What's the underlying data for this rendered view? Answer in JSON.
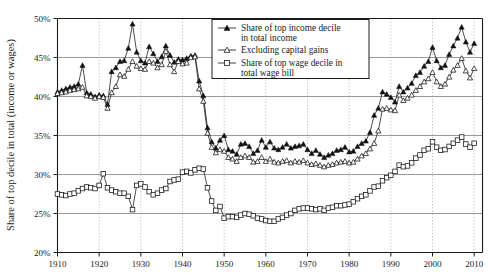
{
  "chart_data": {
    "type": "line",
    "title": "",
    "xlabel": "",
    "ylabel": "Share of top decile in total (income or wages)",
    "xlim": [
      1910,
      2012
    ],
    "ylim": [
      20,
      50
    ],
    "grid": "horizontal-solid-and-vertical-dotted",
    "legend_position": "top-center",
    "y_ticks": [
      "20%",
      "25%",
      "30%",
      "35%",
      "40%",
      "45%",
      "50%"
    ],
    "y_tick_values": [
      20,
      25,
      30,
      35,
      40,
      45,
      50
    ],
    "x_ticks": [
      "1910",
      "1920",
      "1930",
      "1940",
      "1950",
      "1960",
      "1970",
      "1980",
      "1990",
      "2000",
      "2010"
    ],
    "x_tick_values": [
      1910,
      1920,
      1930,
      1940,
      1950,
      1960,
      1970,
      1980,
      1990,
      2000,
      2010
    ],
    "x": [
      1910,
      1911,
      1912,
      1913,
      1914,
      1915,
      1916,
      1917,
      1918,
      1919,
      1920,
      1921,
      1922,
      1923,
      1924,
      1925,
      1926,
      1927,
      1928,
      1929,
      1930,
      1931,
      1932,
      1933,
      1934,
      1935,
      1936,
      1937,
      1938,
      1939,
      1940,
      1941,
      1942,
      1943,
      1944,
      1945,
      1946,
      1947,
      1948,
      1949,
      1950,
      1951,
      1952,
      1953,
      1954,
      1955,
      1956,
      1957,
      1958,
      1959,
      1960,
      1961,
      1962,
      1963,
      1964,
      1965,
      1966,
      1967,
      1968,
      1969,
      1970,
      1971,
      1972,
      1973,
      1974,
      1975,
      1976,
      1977,
      1978,
      1979,
      1980,
      1981,
      1982,
      1983,
      1984,
      1985,
      1986,
      1987,
      1988,
      1989,
      1990,
      1991,
      1992,
      1993,
      1994,
      1995,
      1996,
      1997,
      1998,
      1999,
      2000,
      2001,
      2002,
      2003,
      2004,
      2005,
      2006,
      2007,
      2008,
      2009,
      2010
    ],
    "series": [
      {
        "name": "Share of top income decile in total income",
        "marker": "filled-triangle",
        "values": [
          40.6,
          40.8,
          41.0,
          41.2,
          41.3,
          41.6,
          44.0,
          40.5,
          40.3,
          40.0,
          40.2,
          40.1,
          39.0,
          43.2,
          43.7,
          44.5,
          44.6,
          46.2,
          49.3,
          45.7,
          44.6,
          44.3,
          46.4,
          45.5,
          44.5,
          45.1,
          46.5,
          45.3,
          44.4,
          44.8,
          44.7,
          44.9,
          45.2,
          45.3,
          42.0,
          40.1,
          36.0,
          34.2,
          33.4,
          34.4,
          35.0,
          33.2,
          33.0,
          32.6,
          33.9,
          34.0,
          33.6,
          32.7,
          33.1,
          34.4,
          33.5,
          34.2,
          33.4,
          33.2,
          33.5,
          33.9,
          33.4,
          33.6,
          33.7,
          33.9,
          33.2,
          32.7,
          33.1,
          32.6,
          32.2,
          32.5,
          32.7,
          33.1,
          33.2,
          33.5,
          32.9,
          33.0,
          33.6,
          34.0,
          34.3,
          35.4,
          37.6,
          38.5,
          40.6,
          40.3,
          39.9,
          39.3,
          41.3,
          40.6,
          41.1,
          41.7,
          42.7,
          43.1,
          43.9,
          44.5,
          46.3,
          44.6,
          43.7,
          44.0,
          45.4,
          46.5,
          47.5,
          48.9,
          47.0,
          45.7,
          46.8
        ]
      },
      {
        "name": "Excluding capital gains",
        "marker": "open-triangle",
        "values": [
          40.4,
          40.5,
          40.6,
          40.8,
          40.9,
          41.0,
          41.2,
          40.1,
          40.0,
          39.8,
          40.0,
          39.9,
          38.5,
          40.5,
          41.3,
          42.8,
          42.6,
          43.5,
          44.5,
          43.9,
          43.6,
          43.5,
          44.5,
          44.3,
          43.7,
          44.1,
          45.8,
          44.1,
          43.2,
          44.5,
          44.2,
          44.3,
          45.0,
          45.1,
          41.0,
          39.4,
          35.3,
          33.5,
          32.8,
          33.2,
          33.0,
          32.2,
          32.0,
          31.7,
          32.2,
          32.4,
          32.2,
          31.6,
          31.7,
          32.2,
          31.7,
          32.0,
          31.6,
          31.5,
          31.7,
          31.8,
          31.5,
          31.7,
          31.6,
          31.8,
          31.5,
          31.3,
          31.4,
          31.2,
          31.0,
          31.2,
          31.3,
          31.5,
          31.6,
          31.7,
          31.5,
          31.6,
          32.0,
          32.4,
          32.7,
          33.3,
          34.0,
          35.6,
          38.4,
          38.5,
          38.3,
          38.2,
          40.2,
          39.5,
          39.8,
          40.2,
          40.8,
          41.3,
          41.9,
          42.3,
          43.1,
          41.9,
          41.3,
          41.6,
          42.5,
          43.4,
          44.0,
          44.9,
          43.3,
          42.4,
          43.6
        ]
      },
      {
        "name": "Share of top wage decile in total wage bill",
        "marker": "open-square",
        "values": [
          27.5,
          27.4,
          27.3,
          27.5,
          27.6,
          27.9,
          28.2,
          28.4,
          28.3,
          28.2,
          28.6,
          30.1,
          28.3,
          28.0,
          27.8,
          27.6,
          27.6,
          27.2,
          25.5,
          28.6,
          28.8,
          28.4,
          27.8,
          27.4,
          27.6,
          28.0,
          28.2,
          29.1,
          29.3,
          29.4,
          30.3,
          30.4,
          30.2,
          30.6,
          30.8,
          30.7,
          28.3,
          26.6,
          25.4,
          25.9,
          24.4,
          24.6,
          24.6,
          24.5,
          24.8,
          25.0,
          24.9,
          24.7,
          24.4,
          24.3,
          24.1,
          24.0,
          24.0,
          24.3,
          24.5,
          24.8,
          25.0,
          25.4,
          25.6,
          25.7,
          25.7,
          25.6,
          25.5,
          25.6,
          25.4,
          25.7,
          25.8,
          26.0,
          26.0,
          26.1,
          26.2,
          26.5,
          26.9,
          27.2,
          27.4,
          27.9,
          28.4,
          28.5,
          29.2,
          29.6,
          29.9,
          30.4,
          31.2,
          31.0,
          31.1,
          31.5,
          32.1,
          32.5,
          33.1,
          33.3,
          34.2,
          33.5,
          33.1,
          33.2,
          33.6,
          34.0,
          34.4,
          34.8,
          33.9,
          33.5,
          34.0
        ]
      }
    ]
  },
  "legend": {
    "items": [
      {
        "label_line1": "Share of top income decile",
        "label_line2": "in total income",
        "marker": "filled-triangle"
      },
      {
        "label_line1": "Excluding capital gains",
        "label_line2": "",
        "marker": "open-triangle"
      },
      {
        "label_line1": "Share of top wage decile in",
        "label_line2": "total wage bill",
        "marker": "open-square"
      }
    ]
  },
  "colors": {
    "ink": "#1a1a1a",
    "gridline_solid": "#8f8f8f",
    "gridline_dotted": "#9a9a9a",
    "background": "#ffffff"
  }
}
